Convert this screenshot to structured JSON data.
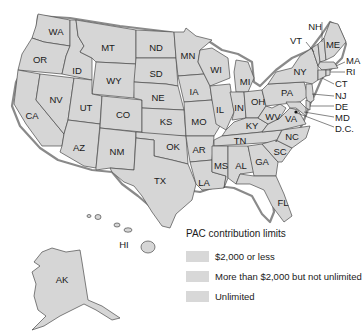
{
  "map": {
    "fill_color": "#d6d6d6",
    "outline_color": "#4a4a4a",
    "state_labels": {
      "WA": "WA",
      "OR": "OR",
      "CA": "CA",
      "ID": "ID",
      "NV": "NV",
      "MT": "MT",
      "WY": "WY",
      "UT": "UT",
      "AZ": "AZ",
      "CO": "CO",
      "NM": "NM",
      "ND": "ND",
      "SD": "SD",
      "NE": "NE",
      "KS": "KS",
      "OK": "OK",
      "TX": "TX",
      "MN": "MN",
      "IA": "IA",
      "MO": "MO",
      "AR": "AR",
      "LA": "LA",
      "WI": "WI",
      "IL": "IL",
      "MI": "MI",
      "IN": "IN",
      "OH": "OH",
      "KY": "KY",
      "TN": "TN",
      "MS": "MS",
      "AL": "AL",
      "GA": "GA",
      "FL": "FL",
      "SC": "SC",
      "NC": "NC",
      "VA": "VA",
      "WV": "WV",
      "PA": "PA",
      "NY": "NY",
      "VT": "VT",
      "NH": "NH",
      "ME": "ME",
      "MA": "MA",
      "RI": "RI",
      "CT": "CT",
      "NJ": "NJ",
      "DE": "DE",
      "MD": "MD",
      "DC": "D.C.",
      "AK": "AK",
      "HI": "HI"
    }
  },
  "legend": {
    "title": "PAC contribution limits",
    "items": [
      {
        "label": "$2,000 or less",
        "color": "#d8d8d8"
      },
      {
        "label": "More than $2,000 but not unlimited",
        "color": "#d8d8d8"
      },
      {
        "label": "Unlimited",
        "color": "#d8d8d8"
      }
    ]
  }
}
